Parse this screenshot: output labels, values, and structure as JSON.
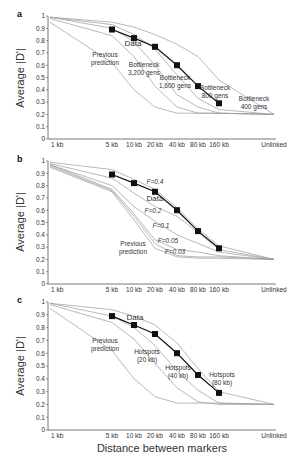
{
  "figure": {
    "x_axis_title": "Distance between markers",
    "y_axis_title": "Average |D'|"
  },
  "chart_data": [
    {
      "panel": "a",
      "type": "line",
      "title": "",
      "xlabel": "",
      "ylabel": "Average |D'|",
      "categories": [
        "1 kb",
        "5 kb",
        "10 kb",
        "20 kb",
        "40 kb",
        "80 kb",
        "160 kb",
        "Unlinked"
      ],
      "yticks": [
        0,
        0.1,
        0.2,
        0.3,
        0.4,
        0.5,
        0.6,
        0.7,
        0.8,
        0.9,
        1
      ],
      "ylim": [
        0,
        1
      ],
      "grid": false,
      "series": [
        {
          "name": "Data",
          "marker": "square",
          "x": [
            "5 kb",
            "10 kb",
            "20 kb",
            "40 kb",
            "80 kb",
            "160 kb"
          ],
          "values": [
            0.89,
            0.82,
            0.75,
            0.6,
            0.43,
            0.29
          ]
        },
        {
          "name": "Previous prediction",
          "values": [
            0.95,
            0.62,
            0.4,
            0.26,
            0.21,
            0.21,
            0.21,
            0.2
          ]
        },
        {
          "name": "Bottleneck 3,200 gens",
          "values": [
            0.98,
            0.84,
            0.67,
            0.43,
            0.26,
            0.21,
            0.21,
            0.2
          ]
        },
        {
          "name": "Bottleneck 1,600 gens",
          "values": [
            0.99,
            0.9,
            0.79,
            0.6,
            0.36,
            0.26,
            0.21,
            0.2
          ]
        },
        {
          "name": "Bottleneck 800 gens",
          "values": [
            0.99,
            0.93,
            0.85,
            0.73,
            0.52,
            0.33,
            0.24,
            0.2
          ]
        },
        {
          "name": "Bottleneck 400 gens",
          "values": [
            0.99,
            0.95,
            0.91,
            0.85,
            0.77,
            0.67,
            0.48,
            0.2
          ]
        }
      ],
      "annotations": [
        {
          "text": "Data"
        },
        {
          "text": "Previous prediction"
        },
        {
          "text": "Bottleneck 3,200 gens"
        },
        {
          "text": "Bottleneck 1,600 gens"
        },
        {
          "text": "Bottleneck 800 gens"
        },
        {
          "text": "Bottleneck 400 gens"
        }
      ]
    },
    {
      "panel": "b",
      "type": "line",
      "title": "",
      "xlabel": "",
      "ylabel": "Average |D'|",
      "categories": [
        "1 kb",
        "5 kb",
        "10 kb",
        "20 kb",
        "40 kb",
        "80 kb",
        "160 kb",
        "Unlinked"
      ],
      "yticks": [
        0,
        0.1,
        0.2,
        0.3,
        0.4,
        0.5,
        0.6,
        0.7,
        0.8,
        0.9,
        1
      ],
      "ylim": [
        0,
        1
      ],
      "grid": false,
      "series": [
        {
          "name": "Data",
          "marker": "square",
          "x": [
            "5 kb",
            "10 kb",
            "20 kb",
            "40 kb",
            "80 kb",
            "160 kb"
          ],
          "values": [
            0.89,
            0.82,
            0.75,
            0.6,
            0.43,
            0.29
          ]
        },
        {
          "name": "F=0.4",
          "values": [
            0.99,
            0.93,
            0.85,
            0.77,
            0.62,
            0.45,
            0.31,
            0.2
          ]
        },
        {
          "name": "F=0.2",
          "values": [
            0.98,
            0.86,
            0.74,
            0.63,
            0.55,
            0.42,
            0.28,
            0.2
          ]
        },
        {
          "name": "F=0.1",
          "values": [
            0.97,
            0.8,
            0.63,
            0.51,
            0.4,
            0.33,
            0.26,
            0.2
          ]
        },
        {
          "name": "F=0.05",
          "values": [
            0.97,
            0.77,
            0.57,
            0.36,
            0.28,
            0.26,
            0.23,
            0.2
          ]
        },
        {
          "name": "F=0.03",
          "values": [
            0.96,
            0.76,
            0.55,
            0.33,
            0.23,
            0.22,
            0.22,
            0.2
          ]
        },
        {
          "name": "Previous prediction",
          "values": [
            0.95,
            0.75,
            0.52,
            0.29,
            0.22,
            0.21,
            0.21,
            0.2
          ]
        }
      ],
      "annotations": [
        {
          "text": "F=0.4"
        },
        {
          "text": "Data"
        },
        {
          "text": "F=0.2"
        },
        {
          "text": "F=0.1"
        },
        {
          "text": "F=0.05"
        },
        {
          "text": "F=0.03"
        },
        {
          "text": "Previous prediction"
        }
      ]
    },
    {
      "panel": "c",
      "type": "line",
      "title": "",
      "xlabel": "Distance between markers",
      "ylabel": "Average |D'|",
      "categories": [
        "1 kb",
        "5 kb",
        "10 kb",
        "20 kb",
        "40 kb",
        "80 kb",
        "160 kb",
        "Unlinked"
      ],
      "yticks": [
        0,
        0.1,
        0.2,
        0.3,
        0.4,
        0.5,
        0.6,
        0.7,
        0.8,
        0.9,
        1
      ],
      "ylim": [
        0,
        1
      ],
      "grid": false,
      "series": [
        {
          "name": "Data",
          "marker": "square",
          "x": [
            "5 kb",
            "10 kb",
            "20 kb",
            "40 kb",
            "80 kb",
            "160 kb"
          ],
          "values": [
            0.89,
            0.82,
            0.75,
            0.6,
            0.43,
            0.29
          ]
        },
        {
          "name": "Previous prediction",
          "values": [
            0.95,
            0.62,
            0.4,
            0.26,
            0.21,
            0.21,
            0.21,
            0.2
          ]
        },
        {
          "name": "Hotspots (20 kb)",
          "values": [
            0.98,
            0.84,
            0.71,
            0.52,
            0.33,
            0.22,
            0.2,
            0.2
          ]
        },
        {
          "name": "Hotspots (40 kb)",
          "values": [
            0.99,
            0.89,
            0.8,
            0.66,
            0.46,
            0.31,
            0.21,
            0.2
          ]
        },
        {
          "name": "Hotspots (80 kb)",
          "values": [
            0.99,
            0.94,
            0.89,
            0.82,
            0.68,
            0.48,
            0.3,
            0.2
          ]
        }
      ],
      "annotations": [
        {
          "text": "Data"
        },
        {
          "text": "Previous prediction"
        },
        {
          "text": "Hotspots (20 kb)"
        },
        {
          "text": "Hotspots (40 kb)"
        },
        {
          "text": "Hotspots (80 kb)"
        }
      ]
    }
  ],
  "layout": {
    "x_positions": [
      50,
      112,
      134,
      155,
      177,
      198,
      219,
      274
    ],
    "x_axis_start": 48,
    "x_axis_end": 276,
    "panels": [
      {
        "letter": "a",
        "top": 16,
        "bottom": 139,
        "letter_x": 17,
        "letter_y": 17,
        "ylabel_y": 78
      },
      {
        "letter": "b",
        "top": 161,
        "bottom": 284,
        "letter_x": 17,
        "letter_y": 162,
        "ylabel_y": 222
      },
      {
        "letter": "c",
        "top": 302,
        "bottom": 430,
        "letter_x": 17,
        "letter_y": 303,
        "ylabel_y": 366
      }
    ],
    "annotation_positions": [
      [
        {
          "x": 133,
          "y": 46,
          "size": 8,
          "lines": [
            "Data"
          ]
        },
        {
          "x": 105,
          "y": 57,
          "lines": [
            "Previous",
            "prediction"
          ]
        },
        {
          "x": 144,
          "y": 67,
          "lines": [
            "Bottleneck",
            "3,200 gens"
          ]
        },
        {
          "x": 175,
          "y": 80,
          "lines": [
            "Bottleneck",
            "1,600 gens"
          ]
        },
        {
          "x": 215,
          "y": 90,
          "lines": [
            "Bottleneck",
            "800 gens"
          ]
        },
        {
          "x": 254,
          "y": 101,
          "lines": [
            "Bottleneck",
            "400 gens"
          ]
        }
      ],
      [
        {
          "x": 155,
          "y": 184,
          "italic": true,
          "lines": [
            "F=0.4"
          ]
        },
        {
          "x": 155,
          "y": 201,
          "size": 8,
          "lines": [
            "Data"
          ]
        },
        {
          "x": 153,
          "y": 213,
          "italic": true,
          "lines": [
            "F=0.2"
          ]
        },
        {
          "x": 161,
          "y": 228,
          "italic": true,
          "lines": [
            "F=0.1"
          ]
        },
        {
          "x": 168,
          "y": 243,
          "italic": true,
          "lines": [
            "F=0.05"
          ]
        },
        {
          "x": 175,
          "y": 254,
          "italic": true,
          "lines": [
            "F=0.03"
          ]
        },
        {
          "x": 133,
          "y": 246,
          "lines": [
            "Previous",
            "prediction"
          ]
        }
      ],
      [
        {
          "x": 135,
          "y": 320,
          "size": 8,
          "lines": [
            "Data"
          ]
        },
        {
          "x": 105,
          "y": 343,
          "lines": [
            "Previous",
            "prediction"
          ]
        },
        {
          "x": 147,
          "y": 354,
          "lines": [
            "Hotspots",
            "(20 kb)"
          ]
        },
        {
          "x": 178,
          "y": 370,
          "lines": [
            "Hotspots",
            "(40 kb)"
          ]
        },
        {
          "x": 222,
          "y": 377,
          "lines": [
            "Hotspots",
            "(80 kb)"
          ]
        }
      ]
    ],
    "colors": {
      "curve": "#9a9a9a",
      "data": "#111111",
      "axis": "#555555",
      "text": "#333333"
    }
  }
}
